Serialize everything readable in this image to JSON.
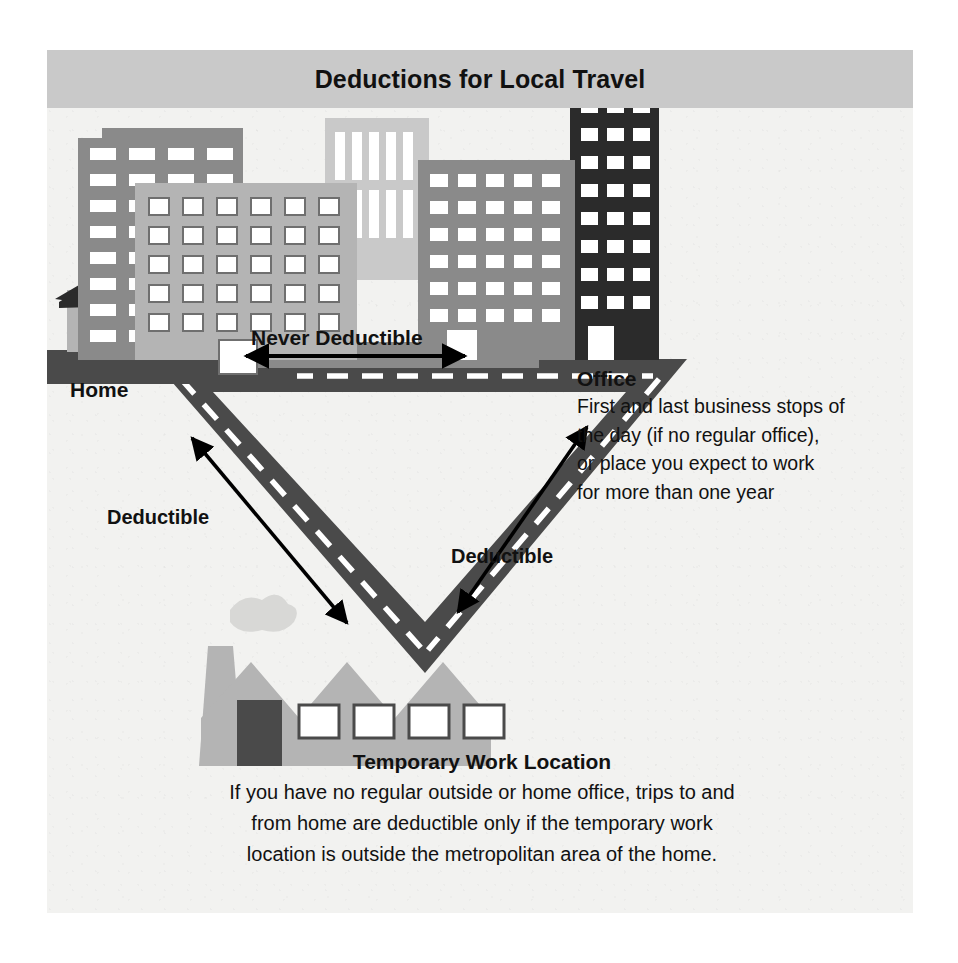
{
  "header": {
    "title": "Deductions for Local Travel"
  },
  "labels": {
    "home": "Home",
    "never_deductible": "Never Deductible",
    "deductible_left": "Deductible",
    "deductible_right": "Deductible"
  },
  "office": {
    "heading": "Office",
    "line1": "First and last business stops of",
    "line2": "the day (if no regular office),",
    "line3": "or place you expect to work",
    "line4": "for more than one year"
  },
  "temporary": {
    "heading": "Temporary Work Location",
    "line1": "If you have no regular outside or home office, trips to and",
    "line2": "from home are deductible only if the temporary work",
    "line3": "location is outside the metropolitan area of the home."
  },
  "icons": {
    "house": "house-icon",
    "office_buildings": "office-buildings-icon",
    "factory": "factory-icon",
    "road": "road-triangle-icon",
    "arrow_never": "double-arrow-horizontal-icon",
    "arrow_left": "double-arrow-diagonal-left-icon",
    "arrow_right": "double-arrow-diagonal-right-icon"
  },
  "colors": {
    "page_background": "#ffffff",
    "panel_background": "#f2f2f0",
    "header_background": "#c9c9c9",
    "road": "#4a4a4a",
    "road_dash": "#ffffff",
    "building_dark": "#2b2b2b",
    "building_mid": "#8a8a8a",
    "building_light": "#b4b4b4",
    "building_pale": "#c9c9c9",
    "roof_dark": "#2b2b2b",
    "factory": "#b4b4b4",
    "text": "#111111",
    "arrow": "#000000"
  }
}
